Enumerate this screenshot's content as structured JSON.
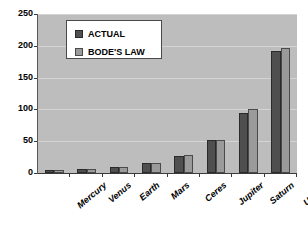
{
  "chart_data": {
    "type": "bar",
    "title": "",
    "subtitle": "",
    "xlabel": "",
    "ylabel": "",
    "categories": [
      "Mercury",
      "Venus",
      "Earth",
      "Mars",
      "Ceres",
      "Jupiter",
      "Saturn",
      "Uranus"
    ],
    "series": [
      {
        "name": "ACTUAL",
        "values": [
          4,
          7,
          10,
          15,
          27,
          52,
          95,
          192
        ]
      },
      {
        "name": "BODE'S LAW",
        "values": [
          4,
          7,
          10,
          16,
          28,
          52,
          100,
          196
        ]
      }
    ],
    "yticks": [
      0,
      50,
      100,
      150,
      200,
      250
    ],
    "ylim": [
      0,
      250
    ],
    "grid": true,
    "legend_position": "upper-left",
    "colors": {
      "actual": "#4f4f4f",
      "bode": "#9a9a9a",
      "plot_background": "#bdbdbd",
      "gridline": "#d4d4d4",
      "axis": "#3a3a3a",
      "legend_background": "#ffffff",
      "page_background": "#ffffff"
    }
  },
  "legend": {
    "items": [
      {
        "label": "ACTUAL",
        "swatch": "actual"
      },
      {
        "label": "BODE'S LAW",
        "swatch": "bode"
      }
    ]
  },
  "axis": {
    "y": {
      "labels": [
        "250",
        "200",
        "150",
        "100",
        "50",
        "0"
      ]
    },
    "x": {
      "labels": [
        "Mercury",
        "Venus",
        "Earth",
        "Mars",
        "Ceres",
        "Jupiter",
        "Saturn",
        "Uranus"
      ]
    }
  }
}
